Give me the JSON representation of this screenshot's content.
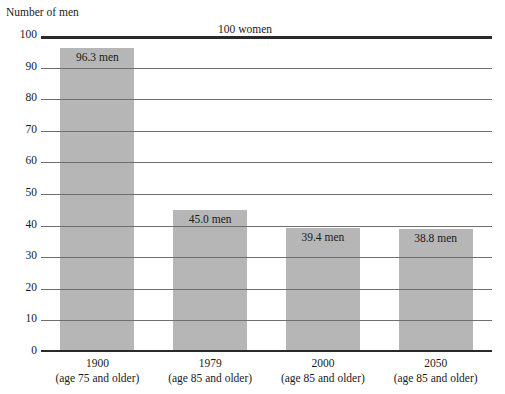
{
  "header": {
    "clipped_title": "",
    "y_axis_title": "Number of men",
    "baseline_note": "100 women"
  },
  "chart_data": {
    "type": "bar",
    "title": "",
    "xlabel": "",
    "ylabel": "Number of men",
    "ylim": [
      0,
      100
    ],
    "yticks": [
      "0",
      "10",
      "20",
      "30",
      "40",
      "50",
      "60",
      "70",
      "80",
      "90",
      "100"
    ],
    "grid": true,
    "legend": "none",
    "annotation": "100 women",
    "categories": [
      {
        "year": "1900",
        "age": "(age 75 and older)"
      },
      {
        "year": "1979",
        "age": "(age 85 and older)"
      },
      {
        "year": "2000",
        "age": "(age 85 and older)"
      },
      {
        "year": "2050",
        "age": "(age 85 and older)"
      }
    ],
    "values": [
      96.3,
      45.0,
      39.4,
      38.8
    ],
    "value_labels": [
      "96.3 men",
      "45.0 men",
      "39.4 men",
      "38.8 men"
    ],
    "bar_color": "#b6b6b6",
    "gridline_color": "#6f6f6f",
    "axis_color": "#2a2a2a"
  }
}
